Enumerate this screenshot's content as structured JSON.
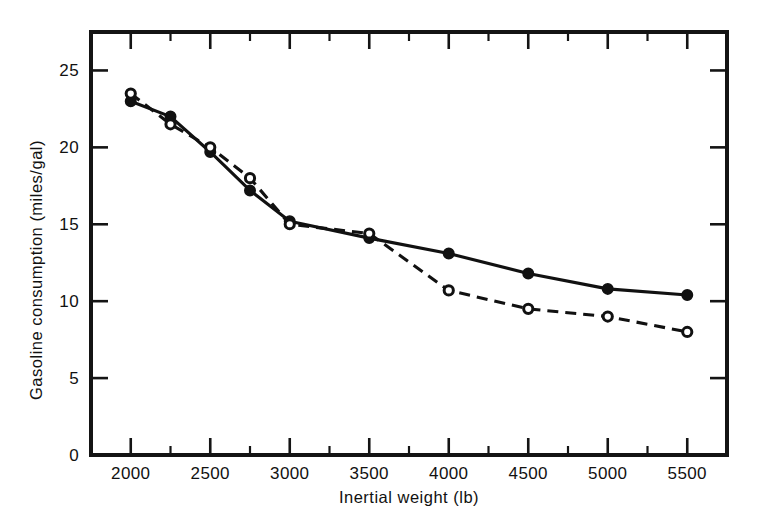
{
  "chart_data": {
    "type": "line",
    "title": "",
    "xlabel": "Inertial weight (lb)",
    "ylabel": "Gasoline consumption (miles/gal)",
    "x": [
      2000,
      2250,
      2500,
      2750,
      3000,
      3500,
      4000,
      4500,
      5000,
      5500
    ],
    "xlim": [
      1750,
      5750
    ],
    "ylim": [
      0,
      27.5
    ],
    "grid": false,
    "legend_position": "none",
    "x_tick_labels": [
      "2000",
      "2500",
      "3000",
      "3500",
      "4000",
      "4500",
      "5000",
      "5500"
    ],
    "x_tick_values": [
      2000,
      2500,
      3000,
      3500,
      4000,
      4500,
      5000,
      5500
    ],
    "x_minor_tick_values": [
      1750,
      2250,
      2750,
      3250,
      3750,
      4250,
      4750,
      5250,
      5750
    ],
    "y_tick_labels": [
      "0",
      "5",
      "10",
      "15",
      "20",
      "25"
    ],
    "y_tick_values": [
      0,
      5,
      10,
      15,
      20,
      25
    ],
    "series": [
      {
        "name": "solid-filled-circles",
        "marker": "filled-circle",
        "line_style": "solid",
        "values": [
          23.0,
          22.0,
          19.7,
          17.2,
          15.2,
          14.1,
          13.1,
          11.8,
          10.8,
          10.4
        ]
      },
      {
        "name": "dashed-open-circles",
        "marker": "open-circle",
        "line_style": "dashed",
        "values": [
          23.5,
          21.5,
          20.0,
          18.0,
          15.0,
          14.4,
          10.7,
          9.5,
          9.0,
          8.0
        ]
      }
    ]
  },
  "colors": {
    "ink": "#111111",
    "background": "#ffffff"
  }
}
